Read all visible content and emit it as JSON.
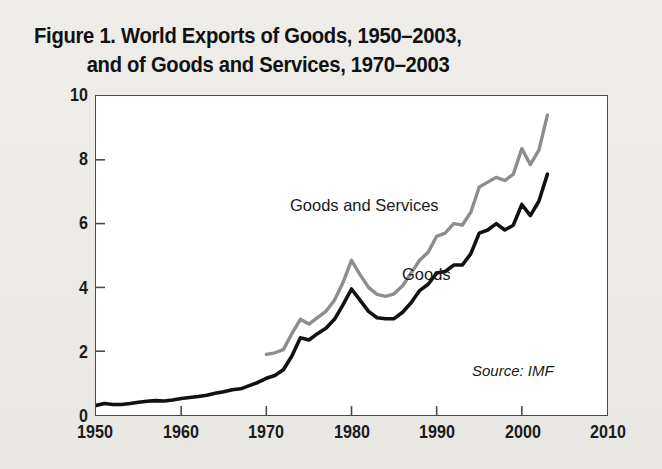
{
  "figure": {
    "title_line_1": "Figure 1. World Exports of Goods, 1950–2003,",
    "title_line_2": "and of Goods and Services, 1970–2003",
    "source_note": "Source: IMF"
  },
  "labels": {
    "goods": "Goods",
    "goods_and_services": "Goods and Services",
    "y_axis_title": "Trillion 2003 Dollars"
  },
  "colors": {
    "goods_line": "#111111",
    "goods_services_line": "#8d8d8d",
    "frame": "#4a4a4a",
    "plot_background": "#ffffff",
    "page_background": "#ecebe8"
  },
  "chart_data": {
    "type": "line",
    "title": "Figure 1. World Exports of Goods, 1950–2003, and of Goods and Services, 1970–2003",
    "xlabel": "",
    "ylabel": "Trillion 2003 Dollars",
    "xlim": [
      1950,
      2010
    ],
    "ylim": [
      0,
      10
    ],
    "xticks": [
      1950,
      1960,
      1970,
      1980,
      1990,
      2000,
      2010
    ],
    "yticks": [
      0,
      2,
      4,
      6,
      8,
      10
    ],
    "grid": false,
    "legend": "inline-annotations",
    "annotations": [
      {
        "text": "Goods and Services",
        "x": 1985,
        "y": 6.3
      },
      {
        "text": "Goods",
        "x": 1994,
        "y": 4.1
      },
      {
        "text": "Source: IMF",
        "x": 2005,
        "y": 1.3
      }
    ],
    "series": [
      {
        "name": "Goods",
        "color": "#111111",
        "x": [
          1950,
          1951,
          1952,
          1953,
          1954,
          1955,
          1956,
          1957,
          1958,
          1959,
          1960,
          1961,
          1962,
          1963,
          1964,
          1965,
          1966,
          1967,
          1968,
          1969,
          1970,
          1971,
          1972,
          1973,
          1974,
          1975,
          1976,
          1977,
          1978,
          1979,
          1980,
          1981,
          1982,
          1983,
          1984,
          1985,
          1986,
          1987,
          1988,
          1989,
          1990,
          1991,
          1992,
          1993,
          1994,
          1995,
          1996,
          1997,
          1998,
          1999,
          2000,
          2001,
          2002,
          2003
        ],
        "values": [
          0.3,
          0.36,
          0.33,
          0.33,
          0.36,
          0.4,
          0.43,
          0.45,
          0.44,
          0.47,
          0.52,
          0.55,
          0.58,
          0.62,
          0.68,
          0.73,
          0.79,
          0.82,
          0.92,
          1.02,
          1.15,
          1.24,
          1.42,
          1.85,
          2.42,
          2.35,
          2.55,
          2.72,
          3.0,
          3.45,
          3.95,
          3.6,
          3.25,
          3.05,
          3.02,
          3.02,
          3.22,
          3.52,
          3.9,
          4.1,
          4.45,
          4.5,
          4.7,
          4.7,
          5.05,
          5.7,
          5.8,
          6.0,
          5.8,
          5.95,
          6.6,
          6.25,
          6.7,
          7.55
        ]
      },
      {
        "name": "Goods and Services",
        "color": "#8d8d8d",
        "x": [
          1970,
          1971,
          1972,
          1973,
          1974,
          1975,
          1976,
          1977,
          1978,
          1979,
          1980,
          1981,
          1982,
          1983,
          1984,
          1985,
          1986,
          1987,
          1988,
          1989,
          1990,
          1991,
          1992,
          1993,
          1994,
          1995,
          1996,
          1997,
          1998,
          1999,
          2000,
          2001,
          2002,
          2003
        ],
        "values": [
          1.9,
          1.95,
          2.05,
          2.55,
          3.0,
          2.85,
          3.05,
          3.25,
          3.6,
          4.15,
          4.85,
          4.4,
          4.0,
          3.78,
          3.72,
          3.8,
          4.05,
          4.45,
          4.85,
          5.1,
          5.6,
          5.7,
          6.0,
          5.95,
          6.35,
          7.15,
          7.3,
          7.45,
          7.35,
          7.55,
          8.35,
          7.85,
          8.3,
          9.4
        ]
      }
    ]
  }
}
